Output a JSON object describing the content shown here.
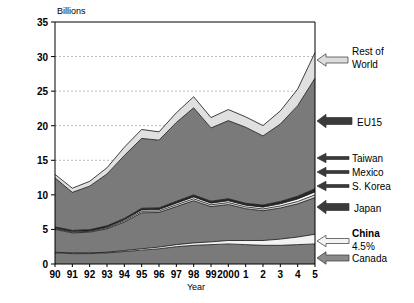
{
  "chart_data": {
    "type": "area",
    "title": "",
    "ylabel": "Billions",
    "xlabel": "Year",
    "ylim": [
      0,
      35
    ],
    "yticks": [
      0,
      5,
      10,
      15,
      20,
      25,
      30,
      35
    ],
    "grid": true,
    "legend_position": "right-callouts",
    "stacked": true,
    "categories": [
      "90",
      "91",
      "92",
      "93",
      "94",
      "95",
      "96",
      "97",
      "98",
      "99",
      "2000",
      "1",
      "2",
      "3",
      "4",
      "5"
    ],
    "series": [
      {
        "name": "Canada",
        "color": "#7a7a7a",
        "values": [
          1.6,
          1.5,
          1.5,
          1.6,
          1.8,
          2.0,
          2.2,
          2.5,
          2.7,
          2.8,
          2.9,
          2.8,
          2.7,
          2.7,
          2.8,
          2.9
        ]
      },
      {
        "name": "China",
        "color": "#f2f2f2",
        "values": [
          0.1,
          0.1,
          0.1,
          0.1,
          0.15,
          0.2,
          0.25,
          0.3,
          0.35,
          0.4,
          0.5,
          0.6,
          0.7,
          0.9,
          1.1,
          1.4
        ]
      },
      {
        "name": "Japan",
        "color": "#7a7a7a",
        "values": [
          3.3,
          2.9,
          3.0,
          3.4,
          4.1,
          5.2,
          5.0,
          5.5,
          6.1,
          5.1,
          5.2,
          4.6,
          4.3,
          4.5,
          4.8,
          5.3
        ]
      },
      {
        "name": "S. Korea",
        "color": "#d9d9d9",
        "values": [
          0.12,
          0.12,
          0.12,
          0.14,
          0.18,
          0.22,
          0.22,
          0.25,
          0.28,
          0.26,
          0.28,
          0.26,
          0.26,
          0.3,
          0.34,
          0.4
        ]
      },
      {
        "name": "Mexico",
        "color": "#ffffff",
        "values": [
          0.1,
          0.1,
          0.1,
          0.12,
          0.16,
          0.2,
          0.2,
          0.24,
          0.26,
          0.24,
          0.26,
          0.24,
          0.26,
          0.3,
          0.36,
          0.42
        ]
      },
      {
        "name": "Taiwan",
        "color": "#2b2b2b",
        "values": [
          0.14,
          0.14,
          0.14,
          0.16,
          0.2,
          0.24,
          0.24,
          0.28,
          0.3,
          0.28,
          0.3,
          0.28,
          0.3,
          0.34,
          0.4,
          0.46
        ]
      },
      {
        "name": "EU15",
        "color": "#7a7a7a",
        "values": [
          7.1,
          5.5,
          6.3,
          7.5,
          9.1,
          10.1,
          9.8,
          11.4,
          12.6,
          10.6,
          11.3,
          11.0,
          10.0,
          11.2,
          13.1,
          16.0
        ]
      },
      {
        "name": "Rest of World",
        "color": "#e0e0e0",
        "values": [
          0.5,
          0.6,
          0.7,
          0.9,
          1.2,
          1.3,
          1.2,
          1.4,
          1.6,
          1.5,
          1.6,
          1.5,
          1.5,
          1.9,
          2.4,
          3.7
        ]
      }
    ],
    "totals": [
      13.0,
      10.9,
      11.9,
      13.9,
      16.9,
      19.5,
      19.1,
      21.9,
      24.2,
      21.2,
      22.3,
      21.3,
      20.0,
      22.1,
      25.3,
      30.6
    ],
    "annotations": [
      {
        "label": "Rest of\nWorld",
        "line1": "Rest of",
        "line2": "World",
        "arrow": "light",
        "target_series": "Rest of World"
      },
      {
        "label": "EU15",
        "arrow": "dark",
        "target_series": "EU15"
      },
      {
        "label": "Taiwan",
        "arrow": "dark-thin",
        "target_series": "Taiwan"
      },
      {
        "label": "Mexico",
        "arrow": "dark-thin",
        "target_series": "Mexico"
      },
      {
        "label": "S. Korea",
        "arrow": "dark-thin",
        "target_series": "S. Korea"
      },
      {
        "label": "Japan",
        "arrow": "dark",
        "target_series": "Japan"
      },
      {
        "label": "China",
        "sublabel": "4.5%",
        "arrow": "light",
        "target_series": "China"
      },
      {
        "label": "Canada",
        "arrow": "mid",
        "target_series": "Canada"
      }
    ]
  },
  "axis": {
    "y_unit_label": "Billions",
    "x_title": "Year",
    "yticks": [
      "0",
      "5",
      "10",
      "15",
      "20",
      "25",
      "30",
      "35"
    ],
    "xticks": [
      "90",
      "91",
      "92",
      "93",
      "94",
      "95",
      "96",
      "97",
      "98",
      "99",
      "2000",
      "1",
      "2",
      "3",
      "4",
      "5"
    ]
  },
  "callouts": {
    "rest_of_world_l1": "Rest of",
    "rest_of_world_l2": "World",
    "eu15": "EU15",
    "taiwan": "Taiwan",
    "mexico": "Mexico",
    "skorea": "S. Korea",
    "japan": "Japan",
    "china": "China",
    "china_pct": "4.5%",
    "canada": "Canada"
  },
  "colors": {
    "band_dark": "#7a7a7a",
    "band_light": "#e0e0e0",
    "band_white": "#ffffff",
    "band_black": "#2b2b2b",
    "band_midlight": "#d9d9d9",
    "grid": "#b9b9b9",
    "axis": "#000000"
  }
}
